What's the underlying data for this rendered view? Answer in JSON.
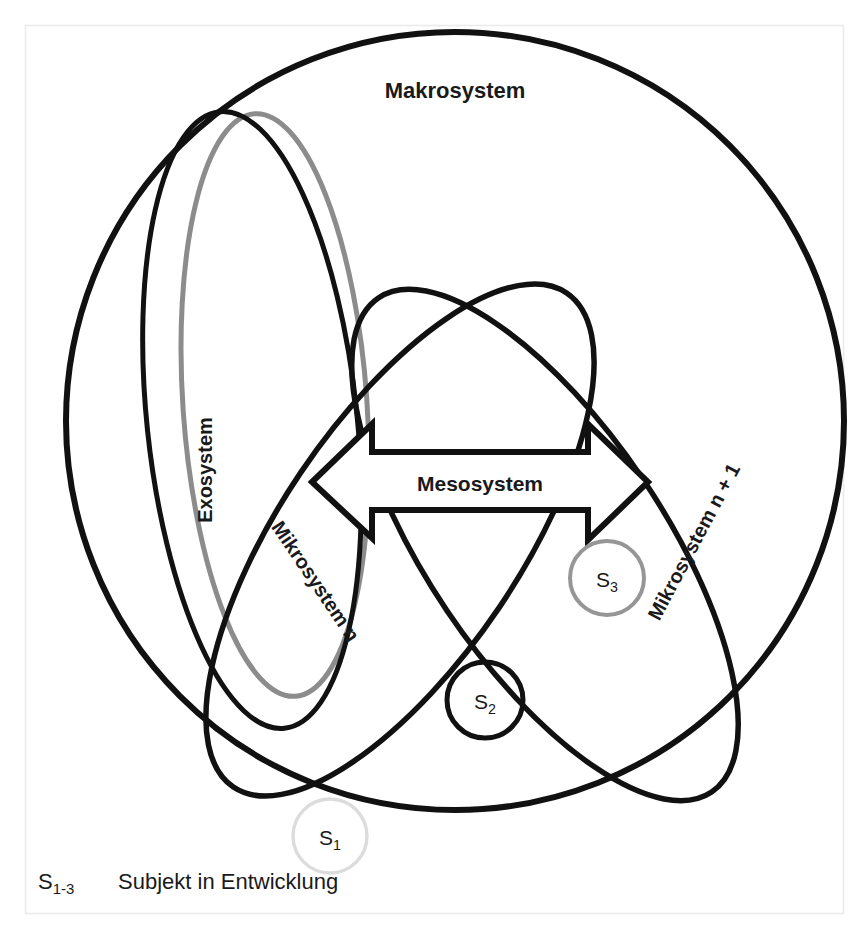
{
  "figure": {
    "kind": "nested-systems-diagram",
    "background_color": "#ffffff",
    "frame_color": "#eceaea",
    "stroke_dark": "#111111",
    "stroke_gray_mid": "#8c8c8c",
    "stroke_gray_light": "#d9d9d9"
  },
  "labels": {
    "macrosystem": "Makrosystem",
    "mesosystem": "Mesosystem",
    "exosystem": "Exosystem",
    "mikrosystem_n": "Mikrosystem n",
    "mikrosystem_n_plus_1": "Mikrosystem n + 1"
  },
  "subjects": [
    {
      "id": "s1",
      "base": "S",
      "index": "1",
      "circle_color": "#dcdcdc",
      "text_color": "#444444"
    },
    {
      "id": "s2",
      "base": "S",
      "index": "2",
      "circle_color": "#111111",
      "text_color": "#1a1a1a"
    },
    {
      "id": "s3",
      "base": "S",
      "index": "3",
      "circle_color": "#969696",
      "text_color": "#3a3a3a"
    }
  ],
  "legend": {
    "key_base": "S",
    "key_index": "1-3",
    "description": "Subjekt in Entwicklung"
  }
}
